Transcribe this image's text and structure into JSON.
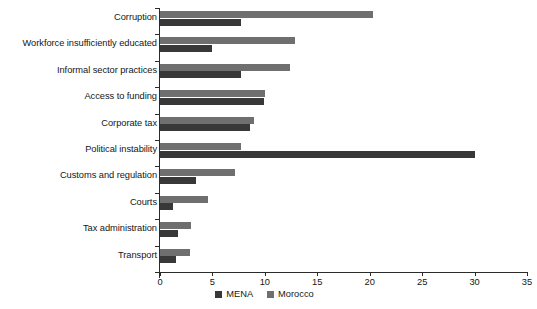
{
  "chart_data": {
    "type": "bar",
    "orientation": "horizontal",
    "title": "",
    "xlabel": "",
    "ylabel": "",
    "xlim": [
      0,
      35
    ],
    "xticks": [
      0,
      5,
      10,
      15,
      20,
      25,
      30,
      35
    ],
    "grid": false,
    "legend_position": "bottom-center",
    "categories": [
      "Corruption",
      "Workforce insufficiently educated",
      "Informal sector practices",
      "Access to funding",
      "Corporate tax",
      "Political instability",
      "Customs and regulation",
      "Courts",
      "Tax administration",
      "Transport"
    ],
    "series": [
      {
        "name": "MENA",
        "color": "#383838",
        "values": [
          7.7,
          5.0,
          7.7,
          9.9,
          8.6,
          30.0,
          3.4,
          1.2,
          1.7,
          1.5
        ]
      },
      {
        "name": "Morocco",
        "color": "#6f6f6f",
        "values": [
          20.3,
          12.9,
          12.4,
          10.0,
          9.0,
          7.7,
          7.2,
          4.6,
          3.0,
          2.9
        ]
      }
    ]
  },
  "axis": {
    "tick_labels": [
      "0",
      "5",
      "10",
      "15",
      "20",
      "25",
      "30",
      "35"
    ]
  },
  "legend": {
    "items": [
      {
        "label": "MENA",
        "color": "#383838"
      },
      {
        "label": "Morocco",
        "color": "#6f6f6f"
      }
    ]
  }
}
